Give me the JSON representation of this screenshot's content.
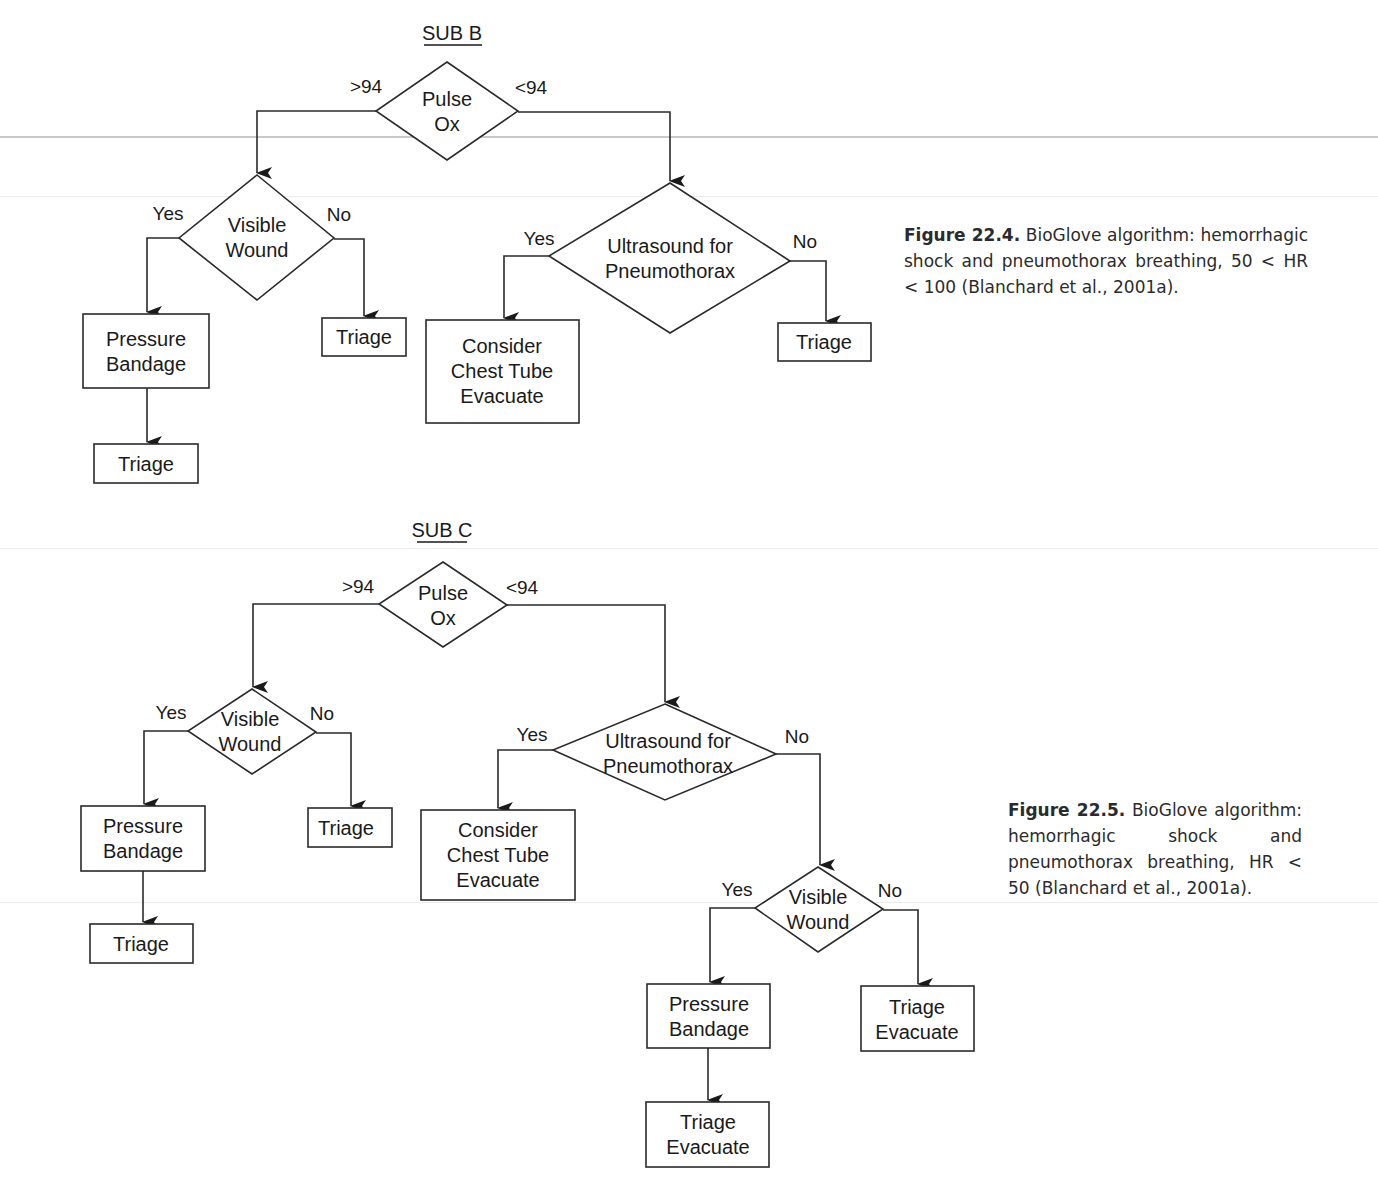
{
  "figure_22_4": {
    "title": "SUB B",
    "pulse_ox": {
      "line1": "Pulse",
      "line2": "Ox",
      "left_label": ">94",
      "right_label": "<94"
    },
    "visible_wound": {
      "line1": "Visible",
      "line2": "Wound",
      "yes": "Yes",
      "no": "No"
    },
    "pressure_bandage": {
      "line1": "Pressure",
      "line2": "Bandage"
    },
    "triage_after_bandage": "Triage",
    "triage_no_wound": "Triage",
    "ultrasound": {
      "line1": "Ultrasound for",
      "line2": "Pneumothorax",
      "yes": "Yes",
      "no": "No"
    },
    "chest_tube": {
      "line1": "Consider",
      "line2": "Chest Tube",
      "line3": "Evacuate"
    },
    "triage_no_pneumo": "Triage",
    "caption": {
      "label": "Figure 22.4.",
      "text": "BioGlove algorithm: hemorrhagic shock and pneumothorax breathing, 50 < HR < 100 (Blanchard et al., 2001a)."
    }
  },
  "figure_22_5": {
    "title": "SUB C",
    "pulse_ox": {
      "line1": "Pulse",
      "line2": "Ox",
      "left_label": ">94",
      "right_label": "<94"
    },
    "visible_wound_left": {
      "line1": "Visible",
      "line2": "Wound",
      "yes": "Yes",
      "no": "No"
    },
    "pressure_bandage_left": {
      "line1": "Pressure",
      "line2": "Bandage"
    },
    "triage_left_bottom": "Triage",
    "triage_left_no": "Triage",
    "ultrasound": {
      "line1": "Ultrasound for",
      "line2": "Pneumothorax",
      "yes": "Yes",
      "no": "No"
    },
    "chest_tube": {
      "line1": "Consider",
      "line2": "Chest Tube",
      "line3": "Evacuate"
    },
    "visible_wound_right": {
      "line1": "Visible",
      "line2": "Wound",
      "yes": "Yes",
      "no": "No"
    },
    "pressure_bandage_right": {
      "line1": "Pressure",
      "line2": "Bandage"
    },
    "triage_evacuate_bottom": {
      "line1": "Triage",
      "line2": "Evacuate"
    },
    "triage_evacuate_no": {
      "line1": "Triage",
      "line2": "Evacuate"
    },
    "caption": {
      "label": "Figure 22.5.",
      "text": "BioGlove algorithm: hemorrhagic shock and pneumothorax breathing, HR < 50 (Blanchard et al., 2001a)."
    }
  }
}
